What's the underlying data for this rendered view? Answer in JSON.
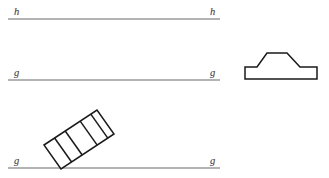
{
  "figure": {
    "background_color": "#ffffff",
    "line_color": "#9a9a9a",
    "shape_stroke_color": "#1a1a1a",
    "shape_fill_color": "#ffffff",
    "label_color": "#2b2b2b"
  },
  "lines": [
    {
      "name": "line-h",
      "label": "h",
      "left_label": "h",
      "right_label": "h",
      "x1": 8,
      "y1": 19,
      "x2": 220,
      "y2": 19,
      "left_label_x": 14,
      "left_label_y": 15,
      "right_label_x": 210,
      "right_label_y": 15
    },
    {
      "name": "line-g-middle",
      "label": "g",
      "left_label": "g",
      "right_label": "g",
      "x1": 8,
      "y1": 80,
      "x2": 220,
      "y2": 80,
      "left_label_x": 14,
      "left_label_y": 76,
      "right_label_x": 210,
      "right_label_y": 76
    },
    {
      "name": "line-g-bottom",
      "label": "g",
      "left_label": "g",
      "right_label": "g",
      "x1": 8,
      "y1": 168,
      "x2": 220,
      "y2": 168,
      "left_label_x": 14,
      "left_label_y": 164,
      "right_label_x": 210,
      "right_label_y": 164
    }
  ],
  "shapes": {
    "stepped_block": {
      "name": "stepped-block",
      "description": "stepped plateau block outline",
      "points": "245,79 245,67 257,67 267,53 287,53 300,67 317,67 317,79"
    },
    "inclined_bar": {
      "name": "inclined-bar",
      "description": "segmented parallelogram resting at an angle on line g",
      "outline": "44,145 97,110 114,134 61,169",
      "dividers": [
        "54.6,138.0 71.6,162.0",
        "65.2,131.0 82.2,155.0",
        "80.2,121.1 97.2,145.1",
        "90.8,114.1 107.8,138.1"
      ]
    }
  }
}
